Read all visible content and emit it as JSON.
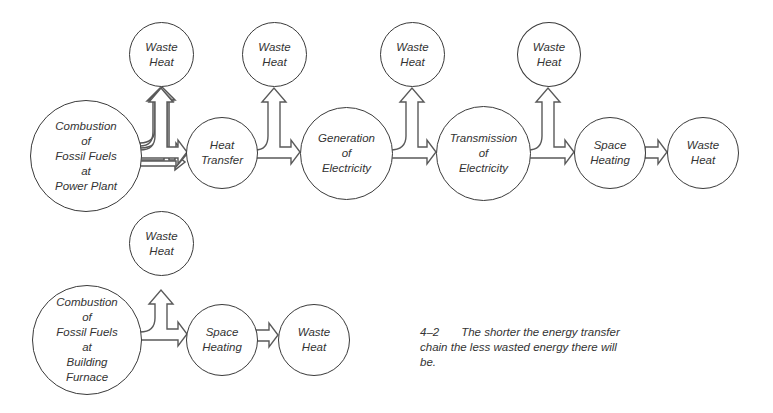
{
  "diagram": {
    "chains": [
      {
        "name": "power-plant-chain",
        "nodes": [
          {
            "id": "combustion-power-plant",
            "lines": [
              "Combustion",
              "of",
              "Fossil Fuels",
              "at",
              "Power Plant"
            ]
          },
          {
            "id": "heat-transfer",
            "lines": [
              "Heat",
              "Transfer"
            ]
          },
          {
            "id": "generation",
            "lines": [
              "Generation",
              "of",
              "Electricity"
            ]
          },
          {
            "id": "transmission",
            "lines": [
              "Transmission",
              "of",
              "Electricity"
            ]
          },
          {
            "id": "space-heating-1",
            "lines": [
              "Space",
              "Heating"
            ]
          },
          {
            "id": "waste-heat-end-1",
            "lines": [
              "Waste",
              "Heat"
            ]
          }
        ],
        "waste_nodes": [
          {
            "lines": [
              "Waste",
              "Heat"
            ]
          },
          {
            "lines": [
              "Waste",
              "Heat"
            ]
          },
          {
            "lines": [
              "Waste",
              "Heat"
            ]
          },
          {
            "lines": [
              "Waste",
              "Heat"
            ]
          }
        ]
      },
      {
        "name": "building-furnace-chain",
        "nodes": [
          {
            "id": "combustion-building-furnace",
            "lines": [
              "Combustion",
              "of",
              "Fossil Fuels",
              "at",
              "Building",
              "Furnace"
            ]
          },
          {
            "id": "space-heating-2",
            "lines": [
              "Space",
              "Heating"
            ]
          },
          {
            "id": "waste-heat-end-2",
            "lines": [
              "Waste",
              "Heat"
            ]
          }
        ],
        "waste_nodes": [
          {
            "lines": [
              "Waste",
              "Heat"
            ]
          }
        ]
      }
    ],
    "caption": {
      "number": "4–2",
      "text": "The shorter the energy transfer chain the less wasted energy there will be."
    },
    "colors": {
      "stroke": "#3a3a3a",
      "text": "#333333",
      "background": "#ffffff"
    }
  }
}
